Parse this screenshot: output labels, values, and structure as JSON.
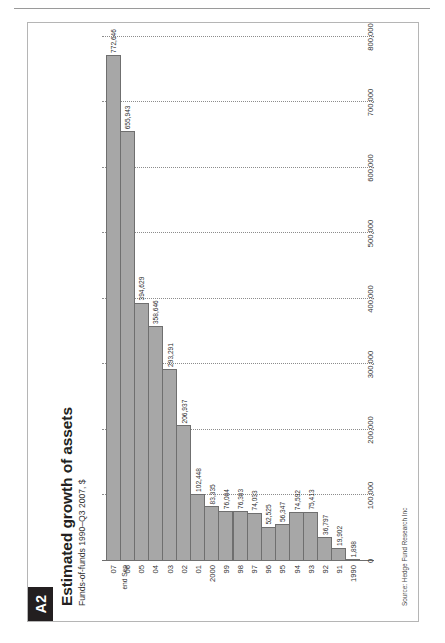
{
  "page": {
    "rule_present": true
  },
  "figure": {
    "badge": "A2",
    "title": "Estimated growth of assets",
    "subtitle": "Funds-of-funds 1990–Q3 2007, $",
    "source": "Source: Hedge Fund Research Inc",
    "note": "end Sep",
    "bar_fill": "#a7a7a7",
    "bar_stroke": "#6f6f6f",
    "badge_bg": "#231f20"
  },
  "chart_data": {
    "type": "bar",
    "orientation": "horizontal",
    "title": "Estimated growth of assets",
    "subtitle": "Funds-of-funds 1990–Q3 2007, $",
    "xlabel": "",
    "ylabel": "",
    "xlim": [
      0,
      800000
    ],
    "grid": true,
    "legend": null,
    "tick_labels": [
      "0",
      "100,000",
      "200,000",
      "300,000",
      "400,000",
      "500,000",
      "600,000",
      "700,000",
      "800,000"
    ],
    "ticks": [
      0,
      100000,
      200000,
      300000,
      400000,
      500000,
      600000,
      700000,
      800000
    ],
    "categories": [
      "1990",
      "91",
      "92",
      "93",
      "94",
      "95",
      "96",
      "97",
      "98",
      "99",
      "2000",
      "01",
      "02",
      "03",
      "04",
      "05",
      "06",
      "07"
    ],
    "values": [
      1898,
      19902,
      36797,
      75413,
      74592,
      56347,
      52525,
      74033,
      76383,
      76084,
      83335,
      102448,
      206937,
      293291,
      358646,
      394629,
      655943,
      772646
    ],
    "value_labels": [
      "1,898",
      "19,902",
      "36,797",
      "75,413",
      "74,592",
      "56,347",
      "52,525",
      "74,033",
      "76,383",
      "76,084",
      "83,335",
      "102,448",
      "206,937",
      "293,291",
      "358,646",
      "394,629",
      "655,943",
      "772,646"
    ],
    "annotations": [
      {
        "category": "07",
        "text": "end Sep"
      }
    ]
  }
}
